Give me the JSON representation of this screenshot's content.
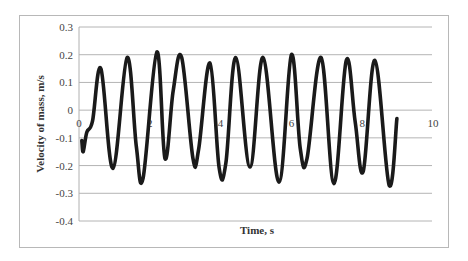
{
  "chart_data": {
    "type": "line",
    "title": "",
    "xlabel": "Time, s",
    "ylabel": "Velocity of mass, m/s",
    "xlim": [
      0,
      10
    ],
    "ylim": [
      -0.4,
      0.3
    ],
    "x_ticks": [
      "0",
      "2",
      "4",
      "6",
      "8",
      "10"
    ],
    "y_ticks": [
      "0.3",
      "0.2",
      "0.1",
      "0",
      "-0.1",
      "-0.2",
      "-0.3",
      "-0.4"
    ],
    "grid": "horizontal",
    "legend": "none",
    "line_color": "#1a1a1a",
    "series": [
      {
        "name": "Velocity of mass",
        "points": [
          [
            0.08,
            -0.11
          ],
          [
            0.12,
            -0.15
          ],
          [
            0.22,
            -0.08
          ],
          [
            0.38,
            -0.04
          ],
          [
            0.62,
            0.15
          ],
          [
            0.96,
            -0.21
          ],
          [
            1.36,
            0.19
          ],
          [
            1.62,
            -0.13
          ],
          [
            1.81,
            -0.245
          ],
          [
            2.2,
            0.21
          ],
          [
            2.43,
            -0.175
          ],
          [
            2.66,
            0.07
          ],
          [
            2.9,
            0.19
          ],
          [
            3.22,
            -0.175
          ],
          [
            3.38,
            -0.14
          ],
          [
            3.7,
            0.17
          ],
          [
            3.96,
            -0.21
          ],
          [
            4.15,
            -0.19
          ],
          [
            4.43,
            0.19
          ],
          [
            4.83,
            -0.205
          ],
          [
            5.2,
            0.19
          ],
          [
            5.65,
            -0.26
          ],
          [
            6.0,
            0.2
          ],
          [
            6.25,
            -0.14
          ],
          [
            6.44,
            -0.175
          ],
          [
            6.84,
            0.19
          ],
          [
            7.2,
            -0.265
          ],
          [
            7.55,
            0.18
          ],
          [
            7.8,
            -0.04
          ],
          [
            8.03,
            -0.22
          ],
          [
            8.36,
            0.18
          ],
          [
            8.76,
            -0.27
          ],
          [
            8.98,
            -0.03
          ]
        ]
      }
    ]
  }
}
